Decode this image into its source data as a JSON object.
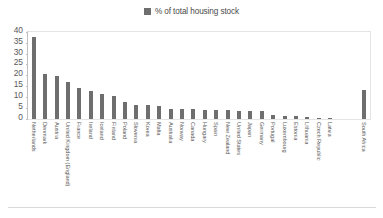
{
  "legend": {
    "entries": [
      {
        "label": "% of total housing stock",
        "color": "#6e6e6e",
        "icon": "square-swatch-icon"
      }
    ]
  },
  "axis": {
    "y_ticks": [
      "40",
      "35",
      "30",
      "25",
      "20",
      "15",
      "10",
      "5",
      "0"
    ]
  },
  "colors": {
    "bar": "#6e6e6e",
    "frame": "#e4e4e4",
    "axis": "#bfbfbf",
    "text": "#595959",
    "background": "#ffffff"
  },
  "chart_data": {
    "type": "bar",
    "title": "",
    "subtitle": "",
    "xlabel": "",
    "ylabel": "",
    "ylim": [
      0,
      40
    ],
    "ytick_step": 5,
    "grid": false,
    "legend_position": "top-center",
    "series_name": "% of total housing stock",
    "categories": [
      "Netherlands",
      "Denmark",
      "Austria",
      "United Kingdom (England)",
      "France",
      "Ireland",
      "Iceland",
      "Finland",
      "Poland",
      "Slovenia",
      "Korea",
      "Malta",
      "Australia",
      "Norway",
      "Canada",
      "Hungary",
      "Spain",
      "New Zealand",
      "United States",
      "Japan",
      "Germany",
      "Portugal",
      "Luxembourg",
      "Estonia",
      "Lithuania",
      "Czech Republic",
      "Latvia",
      "",
      "",
      "South Africa"
    ],
    "values": [
      37.7,
      20.9,
      20.0,
      17.0,
      14.3,
      13.0,
      11.3,
      10.8,
      7.8,
      6.5,
      6.4,
      6.0,
      4.6,
      4.5,
      4.4,
      4.2,
      4.1,
      4.0,
      3.9,
      3.8,
      3.5,
      2.0,
      1.5,
      1.2,
      0.8,
      0.5,
      0.4,
      0,
      0,
      13.5
    ]
  }
}
